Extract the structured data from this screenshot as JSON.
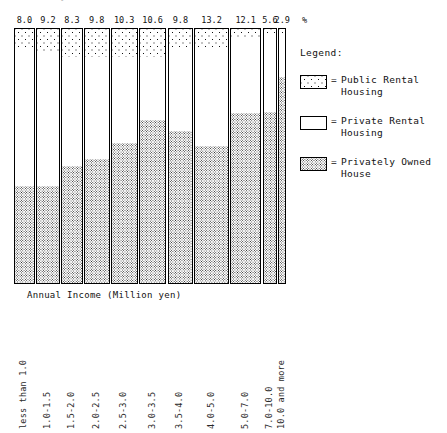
{
  "chart_data": {
    "type": "bar",
    "subtype": "100-percent-stacked-variable-width-mosaic",
    "title": "",
    "xlabel": "Annual Income (Million yen)",
    "ylabel": "",
    "unit_symbol": "%",
    "ylim": [
      0,
      100
    ],
    "grid": false,
    "legend_position": "right",
    "categories": [
      "less than 1.0",
      "1.0-1.5",
      "1.5-2.0",
      "2.0-2.5",
      "2.5-3.0",
      "3.0-3.5",
      "3.5-4.0",
      "4.0-5.0",
      "5.0-7.0",
      "7.0-10.0",
      "10.0 and more"
    ],
    "column_width_percents": [
      8.0,
      9.2,
      8.3,
      9.8,
      10.3,
      10.6,
      9.8,
      13.2,
      12.1,
      5.6,
      2.9
    ],
    "column_width_labels": [
      "8.0",
      "9.2",
      "8.3",
      "9.8",
      "10.3",
      "10.6",
      "9.8",
      "13.2",
      "12.1",
      "5.6",
      "2.9"
    ],
    "series": [
      {
        "name": "Public Rental Housing",
        "key": "public",
        "fill": "dotted-sparse",
        "values": [
          7.0,
          9.5,
          11.0,
          11.0,
          11.0,
          11.0,
          8.0,
          7.0,
          4.0,
          2.5,
          2.0
        ]
      },
      {
        "name": "Private Rental Housing",
        "key": "private",
        "fill": "white",
        "values": [
          55.0,
          52.5,
          43.0,
          40.0,
          34.0,
          25.0,
          32.0,
          39.0,
          29.0,
          30.0,
          17.0
        ]
      },
      {
        "name": "Privately Owned House",
        "key": "owned",
        "fill": "stipple-dense",
        "values": [
          38.0,
          38.0,
          46.0,
          49.0,
          55.0,
          64.0,
          60.0,
          54.0,
          67.0,
          67.5,
          81.0
        ]
      }
    ]
  },
  "legend": {
    "title": "Legend:",
    "equals": "=",
    "items": [
      {
        "label": "Public Rental\nHousing",
        "swatch": "dotted-sparse"
      },
      {
        "label": "Private Rental\nHousing",
        "swatch": "white"
      },
      {
        "label": "Privately Owned\nHouse",
        "swatch": "stipple-dense"
      }
    ]
  },
  "title_sliver": "Tenure by Annual Income of Household"
}
